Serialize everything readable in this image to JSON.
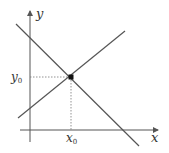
{
  "diagram": {
    "axes": {
      "x_label": "x",
      "y_label": "y"
    },
    "point": {
      "x_label": "x",
      "x_sub": "0",
      "y_label": "y",
      "y_sub": "0"
    },
    "lines": [
      {
        "name": "decreasing-line",
        "from": [
          16,
          24
        ],
        "to": [
          138,
          145
        ]
      },
      {
        "name": "increasing-line",
        "from": [
          18,
          118
        ],
        "to": [
          125,
          31
        ]
      }
    ],
    "colors": {
      "line": "#555555",
      "axis": "#555555",
      "point": "#111111",
      "guide": "#777777"
    }
  }
}
